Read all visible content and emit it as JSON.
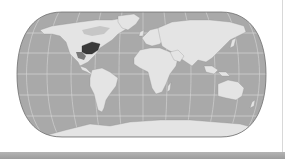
{
  "map": {
    "title": "World map",
    "projection": "pseudocylindrical (rounded ends)",
    "extent": {
      "left": 17,
      "right": 266,
      "top": 12,
      "bottom": 137
    },
    "colors": {
      "ocean": "#a9a9a9",
      "land": "#e6e6e6",
      "land_shade": "#cfcfcf",
      "highlight_region": "#3a3a3a",
      "graticule": "#d9d9d9",
      "outline": "#6e6e6e",
      "bottom_bar": "#a8a8a8"
    },
    "graticule": {
      "parallels_y": [
        33,
        53,
        74,
        95,
        116
      ],
      "central_meridian_x": 143
    },
    "highlighted_region": "Eastern United States / Great Lakes"
  }
}
